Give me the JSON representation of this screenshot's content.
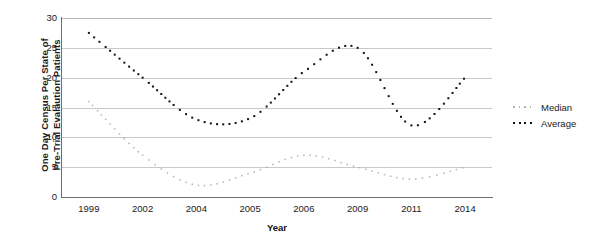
{
  "chart_data": {
    "type": "line",
    "title": "",
    "xlabel": "Year",
    "ylabel": "One Day Census Per State of Pre-Trial Evalaution Patients",
    "ylabel_line1": "One Day Census Per State of",
    "ylabel_line2": "Pre-Trial Evalaution Patients",
    "grid": true,
    "legend_position": "right",
    "xlim": [
      1999,
      2014
    ],
    "ylim": [
      0,
      30
    ],
    "yticks": [
      30,
      25,
      20,
      15,
      10,
      5,
      0
    ],
    "xticks": [
      "1999",
      "2002",
      "2004",
      "2005",
      "2006",
      "2009",
      "2011",
      "2014"
    ],
    "categories": [
      1999,
      2002,
      2004,
      2005,
      2006,
      2009,
      2011,
      2014
    ],
    "series": [
      {
        "name": "Median",
        "color": "#b3b3b3",
        "style": "dotted",
        "values": [
          16,
          7,
          2,
          4,
          7,
          5,
          3,
          5
        ]
      },
      {
        "name": "Average",
        "color": "#111111",
        "style": "dotted",
        "values": [
          27.5,
          20,
          13,
          13.2,
          21,
          25,
          12,
          20
        ]
      }
    ]
  },
  "legend": {
    "items": [
      {
        "label": "Median",
        "color": "#b3b3b3"
      },
      {
        "label": "Average",
        "color": "#111111"
      }
    ]
  }
}
